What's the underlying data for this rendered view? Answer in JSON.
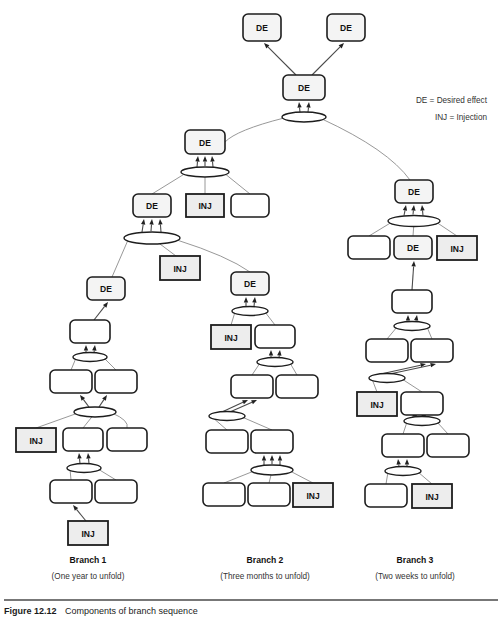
{
  "figure": {
    "legend": {
      "de_line": "DE = Desired effect",
      "inj_line": "INJ = Injection"
    },
    "branches": [
      {
        "title": "Branch 1",
        "subtitle": "(One year to unfold)"
      },
      {
        "title": "Branch 2",
        "subtitle": "(Three months to unfold)"
      },
      {
        "title": "Branch 3",
        "subtitle": "(Two weeks to unfold)"
      }
    ],
    "caption": {
      "number": "Figure 12.12",
      "rest": "Components of branch sequence"
    },
    "colors": {
      "box_fill": "#f4f4f4",
      "box_fill_empty": "#ffffff",
      "box_stroke": "#1d1d1d",
      "edge": "#8c8c8c",
      "text": "#111111",
      "background": "#ffffff"
    },
    "labels": {
      "de": "DE",
      "inj": "INJ",
      "blank": ""
    },
    "nodes": [
      {
        "id": "n-top-left",
        "label": "DE",
        "kind": "de",
        "x": 243,
        "y": 14,
        "w": 38,
        "h": 27
      },
      {
        "id": "n-top-right",
        "label": "DE",
        "kind": "de",
        "x": 327,
        "y": 14,
        "w": 38,
        "h": 27
      },
      {
        "id": "n-root",
        "label": "DE",
        "kind": "de",
        "x": 283,
        "y": 75,
        "w": 42,
        "h": 25
      },
      {
        "id": "n-b1-de1",
        "label": "DE",
        "kind": "de",
        "x": 185,
        "y": 130,
        "w": 40,
        "h": 24
      },
      {
        "id": "n-b1-de2",
        "label": "DE",
        "kind": "de",
        "x": 133,
        "y": 194,
        "w": 38,
        "h": 23
      },
      {
        "id": "n-b1-inj-top",
        "label": "INJ",
        "kind": "inj",
        "x": 186,
        "y": 194,
        "w": 38,
        "h": 23
      },
      {
        "id": "n-b1-blank-top",
        "label": "",
        "kind": "blank",
        "x": 231,
        "y": 194,
        "w": 38,
        "h": 23
      },
      {
        "id": "n-b1-inj-mid",
        "label": "INJ",
        "kind": "inj",
        "x": 160,
        "y": 256,
        "w": 40,
        "h": 24
      },
      {
        "id": "n-b1-de3",
        "label": "DE",
        "kind": "de",
        "x": 87,
        "y": 277,
        "w": 38,
        "h": 23
      },
      {
        "id": "n-b1-blank-1",
        "label": "",
        "kind": "blank",
        "x": 70,
        "y": 320,
        "w": 40,
        "h": 23
      },
      {
        "id": "n-b1-blank-2",
        "label": "",
        "kind": "blank",
        "x": 50,
        "y": 370,
        "w": 42,
        "h": 23
      },
      {
        "id": "n-b1-blank-3",
        "label": "",
        "kind": "blank",
        "x": 95,
        "y": 370,
        "w": 42,
        "h": 23
      },
      {
        "id": "n-b1-inj-low",
        "label": "INJ",
        "kind": "inj",
        "x": 16,
        "y": 428,
        "w": 40,
        "h": 24
      },
      {
        "id": "n-b1-blank-4",
        "label": "",
        "kind": "blank",
        "x": 63,
        "y": 428,
        "w": 40,
        "h": 23
      },
      {
        "id": "n-b1-blank-5",
        "label": "",
        "kind": "blank",
        "x": 107,
        "y": 428,
        "w": 40,
        "h": 23
      },
      {
        "id": "n-b1-blank-6",
        "label": "",
        "kind": "blank",
        "x": 50,
        "y": 480,
        "w": 42,
        "h": 23
      },
      {
        "id": "n-b1-blank-7",
        "label": "",
        "kind": "blank",
        "x": 95,
        "y": 480,
        "w": 42,
        "h": 23
      },
      {
        "id": "n-b1-inj-bot",
        "label": "INJ",
        "kind": "inj",
        "x": 68,
        "y": 521,
        "w": 40,
        "h": 24
      },
      {
        "id": "n-b2-de1",
        "label": "DE",
        "kind": "de",
        "x": 231,
        "y": 272,
        "w": 38,
        "h": 23
      },
      {
        "id": "n-b2-inj-1",
        "label": "INJ",
        "kind": "inj",
        "x": 211,
        "y": 325,
        "w": 40,
        "h": 24
      },
      {
        "id": "n-b2-blank-1",
        "label": "",
        "kind": "blank",
        "x": 255,
        "y": 325,
        "w": 40,
        "h": 23
      },
      {
        "id": "n-b2-blank-2",
        "label": "",
        "kind": "blank",
        "x": 231,
        "y": 375,
        "w": 42,
        "h": 23
      },
      {
        "id": "n-b2-blank-3",
        "label": "",
        "kind": "blank",
        "x": 276,
        "y": 375,
        "w": 42,
        "h": 23
      },
      {
        "id": "n-b2-blank-4",
        "label": "",
        "kind": "blank",
        "x": 206,
        "y": 430,
        "w": 42,
        "h": 23
      },
      {
        "id": "n-b2-blank-5",
        "label": "",
        "kind": "blank",
        "x": 251,
        "y": 430,
        "w": 42,
        "h": 23
      },
      {
        "id": "n-b2-blank-6",
        "label": "",
        "kind": "blank",
        "x": 203,
        "y": 483,
        "w": 42,
        "h": 23
      },
      {
        "id": "n-b2-blank-7",
        "label": "",
        "kind": "blank",
        "x": 248,
        "y": 483,
        "w": 42,
        "h": 23
      },
      {
        "id": "n-b2-inj-bot",
        "label": "INJ",
        "kind": "inj",
        "x": 293,
        "y": 483,
        "w": 40,
        "h": 24
      },
      {
        "id": "n-b3-de1",
        "label": "DE",
        "kind": "de",
        "x": 395,
        "y": 180,
        "w": 38,
        "h": 23
      },
      {
        "id": "n-b3-blank-1",
        "label": "",
        "kind": "blank",
        "x": 348,
        "y": 236,
        "w": 42,
        "h": 23
      },
      {
        "id": "n-b3-de2",
        "label": "DE",
        "kind": "de",
        "x": 394,
        "y": 236,
        "w": 38,
        "h": 23
      },
      {
        "id": "n-b3-inj-1",
        "label": "INJ",
        "kind": "inj",
        "x": 437,
        "y": 236,
        "w": 40,
        "h": 24
      },
      {
        "id": "n-b3-blank-2",
        "label": "",
        "kind": "blank",
        "x": 392,
        "y": 290,
        "w": 40,
        "h": 23
      },
      {
        "id": "n-b3-blank-3",
        "label": "",
        "kind": "blank",
        "x": 366,
        "y": 339,
        "w": 42,
        "h": 23
      },
      {
        "id": "n-b3-blank-4",
        "label": "",
        "kind": "blank",
        "x": 411,
        "y": 339,
        "w": 42,
        "h": 23
      },
      {
        "id": "n-b3-inj-2",
        "label": "INJ",
        "kind": "inj",
        "x": 357,
        "y": 392,
        "w": 40,
        "h": 24
      },
      {
        "id": "n-b3-blank-5",
        "label": "",
        "kind": "blank",
        "x": 401,
        "y": 392,
        "w": 42,
        "h": 23
      },
      {
        "id": "n-b3-blank-6",
        "label": "",
        "kind": "blank",
        "x": 382,
        "y": 434,
        "w": 42,
        "h": 23
      },
      {
        "id": "n-b3-blank-7",
        "label": "",
        "kind": "blank",
        "x": 427,
        "y": 434,
        "w": 42,
        "h": 23
      },
      {
        "id": "n-b3-blank-8",
        "label": "",
        "kind": "blank",
        "x": 365,
        "y": 484,
        "w": 42,
        "h": 23
      },
      {
        "id": "n-b3-inj-bot",
        "label": "INJ",
        "kind": "inj",
        "x": 412,
        "y": 484,
        "w": 40,
        "h": 24
      }
    ],
    "connectors": [
      {
        "id": "c-root",
        "cx": 304,
        "cy": 117,
        "rx": 22,
        "ry": 5
      },
      {
        "id": "c-b1-a",
        "cx": 205,
        "cy": 172,
        "rx": 24,
        "ry": 5
      },
      {
        "id": "c-b1-b",
        "cx": 152,
        "cy": 238,
        "rx": 28,
        "ry": 6
      },
      {
        "id": "c-b1-c",
        "cx": 90,
        "cy": 357,
        "rx": 17,
        "ry": 4.5
      },
      {
        "id": "c-b1-d",
        "cx": 95,
        "cy": 412,
        "rx": 21,
        "ry": 5
      },
      {
        "id": "c-b1-e",
        "cx": 84,
        "cy": 468,
        "rx": 17,
        "ry": 4.5
      },
      {
        "id": "c-b2-a",
        "cx": 250,
        "cy": 311,
        "rx": 18,
        "ry": 4.5
      },
      {
        "id": "c-b2-b",
        "cx": 275,
        "cy": 362,
        "rx": 18,
        "ry": 4.5
      },
      {
        "id": "c-b2-c",
        "cx": 227,
        "cy": 416,
        "rx": 18,
        "ry": 4.5
      },
      {
        "id": "c-b2-d",
        "cx": 272,
        "cy": 470,
        "rx": 21,
        "ry": 5
      },
      {
        "id": "c-b3-a",
        "cx": 414,
        "cy": 221,
        "rx": 26,
        "ry": 5.5
      },
      {
        "id": "c-b3-b",
        "cx": 412,
        "cy": 326,
        "rx": 18,
        "ry": 4.5
      },
      {
        "id": "c-b3-c",
        "cx": 387,
        "cy": 378,
        "rx": 18,
        "ry": 4.5
      },
      {
        "id": "c-b3-d",
        "cx": 422,
        "cy": 421,
        "rx": 18,
        "ry": 4.5
      },
      {
        "id": "c-b3-e",
        "cx": 403,
        "cy": 471,
        "rx": 18,
        "ry": 4.5
      }
    ],
    "branch_label_positions": [
      {
        "x": 88,
        "title_y": 563,
        "sub_y": 579
      },
      {
        "x": 265,
        "title_y": 563,
        "sub_y": 579
      },
      {
        "x": 415,
        "title_y": 563,
        "sub_y": 579
      }
    ],
    "legend_position": {
      "x": 487,
      "de_y": 103,
      "inj_y": 120
    },
    "caption_position": {
      "rule_y": 600,
      "text_y": 614
    }
  }
}
